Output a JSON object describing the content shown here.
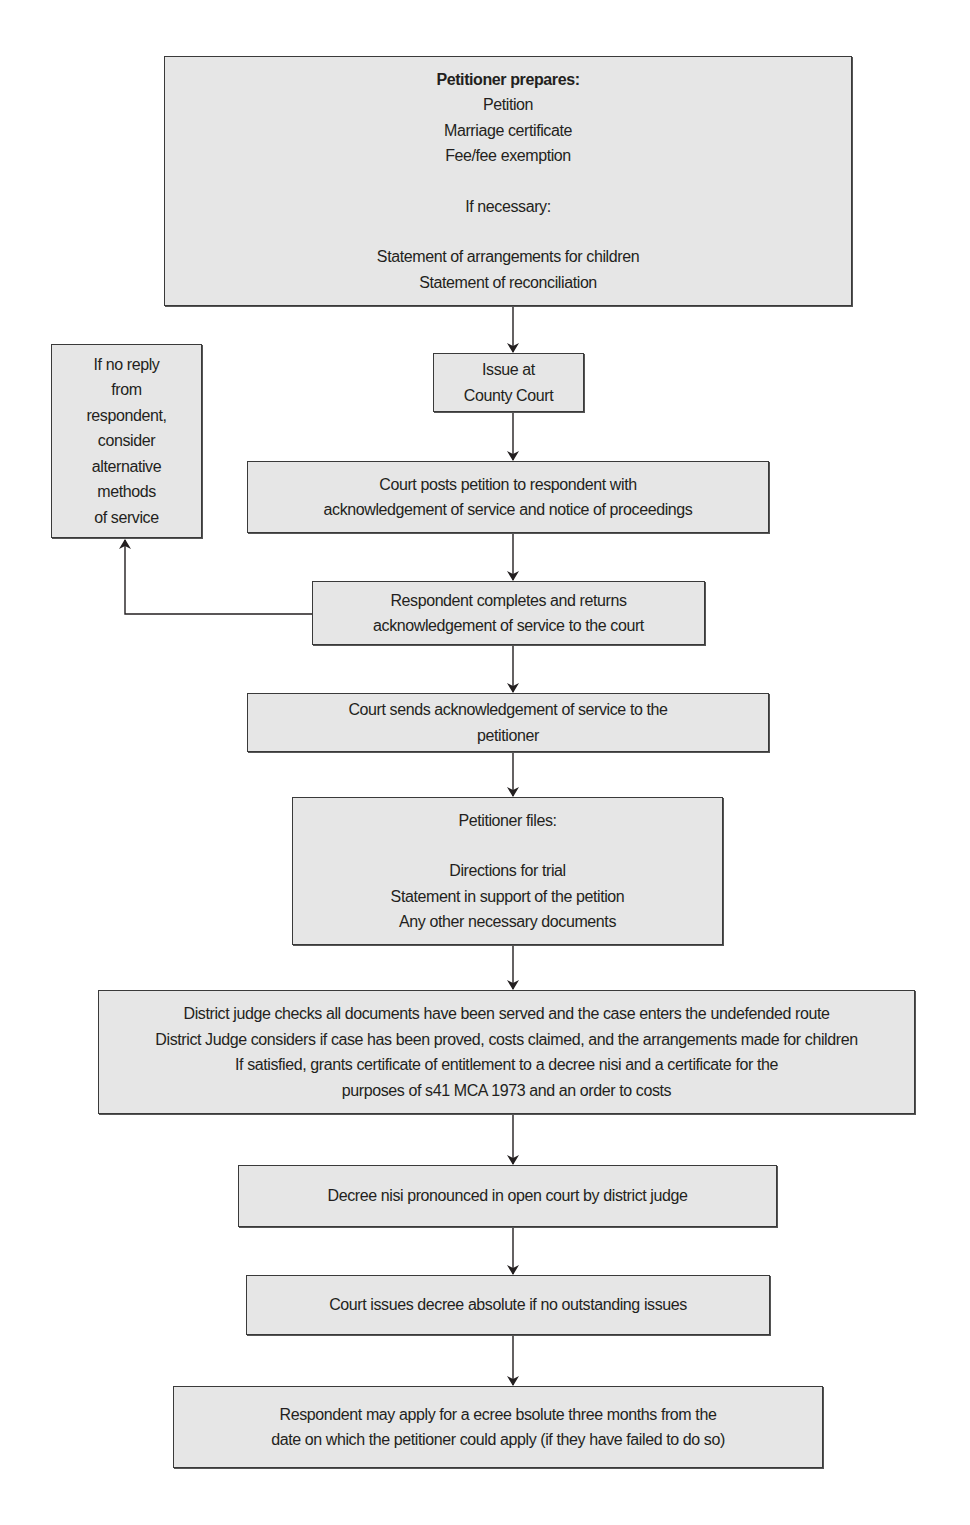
{
  "diagram": {
    "type": "flowchart",
    "colors": {
      "box_fill": "#e6e6e6",
      "box_border": "#3a3a3a",
      "line": "#231f20",
      "text": "#231f20"
    },
    "nodes": {
      "prepares": {
        "title": "Petitioner prepares:",
        "items": [
          "Petition",
          "Marriage certificate",
          "Fee/fee exemption"
        ],
        "subtitle": "If necessary:",
        "optional_items": [
          "Statement of arrangements for children",
          "Statement of reconciliation"
        ]
      },
      "issue": {
        "lines": [
          "Issue at",
          "County Court"
        ]
      },
      "no_reply": {
        "lines": [
          "If no reply",
          "from",
          "respondent,",
          "consider",
          "alternative",
          "methods",
          "of service"
        ]
      },
      "posts": {
        "lines": [
          "Court posts petition to respondent with",
          "acknowledgement of service and notice of proceedings"
        ]
      },
      "returns": {
        "lines": [
          "Respondent completes and returns",
          "acknowledgement of service to the court"
        ]
      },
      "sends": {
        "lines": [
          "Court sends acknowledgement of service to the",
          "petitioner"
        ]
      },
      "files": {
        "title": "Petitioner files:",
        "items": [
          "Directions for trial",
          "Statement in support of the petition",
          "Any other necessary documents"
        ]
      },
      "judge": {
        "lines": [
          "District judge checks all documents have been served and the case enters the undefended route",
          "District Judge considers if case has been proved, costs claimed, and the arrangements made for children",
          "If satisfied, grants certificate of entitlement to a decree nisi and a certificate for the",
          "purposes of s41 MCA 1973 and an order to costs"
        ]
      },
      "nisi": {
        "lines": [
          "Decree nisi pronounced in open court by district judge"
        ]
      },
      "absolute": {
        "lines": [
          "Court issues decree absolute if no outstanding issues"
        ]
      },
      "respondent_apply": {
        "lines": [
          "Respondent may apply for a ecree bsolute three months from the",
          "date on which the petitioner could apply (if they have failed to do so)"
        ]
      }
    },
    "edges": [
      [
        "prepares",
        "issue"
      ],
      [
        "issue",
        "posts"
      ],
      [
        "posts",
        "returns"
      ],
      [
        "returns",
        "no_reply"
      ],
      [
        "returns",
        "sends"
      ],
      [
        "sends",
        "files"
      ],
      [
        "files",
        "judge"
      ],
      [
        "judge",
        "nisi"
      ],
      [
        "nisi",
        "absolute"
      ],
      [
        "absolute",
        "respondent_apply"
      ]
    ]
  }
}
